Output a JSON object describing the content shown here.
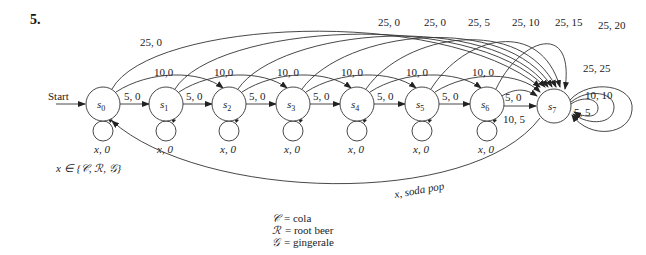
{
  "problem_number": "5.",
  "start_label": "Start",
  "states": [
    {
      "id": "s0",
      "base": "s",
      "sub": "0"
    },
    {
      "id": "s1",
      "base": "s",
      "sub": "1"
    },
    {
      "id": "s2",
      "base": "s",
      "sub": "2"
    },
    {
      "id": "s3",
      "base": "s",
      "sub": "3"
    },
    {
      "id": "s4",
      "base": "s",
      "sub": "4"
    },
    {
      "id": "s5",
      "base": "s",
      "sub": "5"
    },
    {
      "id": "s6",
      "base": "s",
      "sub": "6"
    },
    {
      "id": "s7",
      "base": "s",
      "sub": "7"
    }
  ],
  "edges": {
    "nickel": [
      "5, 0",
      "5, 0",
      "5, 0",
      "5, 0",
      "5, 0",
      "5, 0",
      "5, 0"
    ],
    "dime": [
      "10,0",
      "10,0",
      "10, 0",
      "10, 0",
      "10, 0",
      "10, 0",
      "10, 5"
    ],
    "quarter": [
      "25, 0",
      "25, 0",
      "25, 0",
      "25, 5",
      "25, 10",
      "25, 15",
      "25, 20"
    ],
    "self_loops_s7": [
      "25, 25",
      "10, 10",
      "5, 5"
    ],
    "self_loop_label": "x, 0",
    "return_label": "x, soda pop"
  },
  "x_domain": "x ∈ {𝒞, ℛ, 𝒢}",
  "legend": [
    {
      "symbol": "𝒞",
      "text": "= cola"
    },
    {
      "symbol": "ℛ",
      "text": "= root beer"
    },
    {
      "symbol": "𝒢",
      "text": "= gingerale"
    }
  ]
}
